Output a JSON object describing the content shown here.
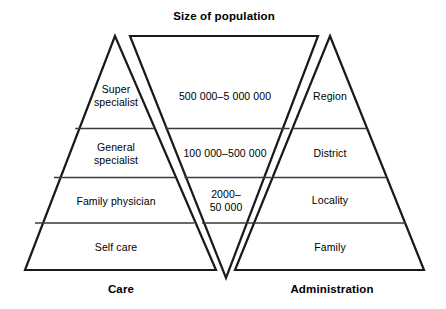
{
  "figure": {
    "title": "Size of population",
    "caption_left": "Care",
    "caption_right": "Administration"
  },
  "care_pyramid": {
    "name": "Care",
    "tiers": [
      {
        "label": "Super\nspecialist"
      },
      {
        "label": "General\nspecialist"
      },
      {
        "label": "Family physician"
      },
      {
        "label": "Self care"
      }
    ]
  },
  "population_funnel": {
    "name": "Size of population",
    "tiers": [
      {
        "label": "500 000–5 000 000"
      },
      {
        "label": "100 000–500 000"
      },
      {
        "label": "2000–\n50 000"
      },
      {
        "label": ""
      }
    ]
  },
  "administration_pyramid": {
    "name": "Administration",
    "tiers": [
      {
        "label": "Region"
      },
      {
        "label": "District"
      },
      {
        "label": "Locality"
      },
      {
        "label": "Family"
      }
    ]
  },
  "style": {
    "stroke": "#1a1a1a",
    "divider": "#3a3a3a",
    "background": "#ffffff"
  }
}
